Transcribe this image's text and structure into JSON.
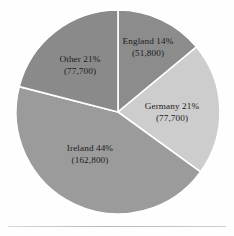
{
  "figure": {
    "background_color": "#fefefe",
    "rule_color": "#c2c2c2"
  },
  "chart_data": {
    "type": "pie",
    "title": "",
    "subtitle": "",
    "xlabel": "",
    "ylabel": "",
    "legend_position": "none",
    "grid": false,
    "label_style": "inside-slice",
    "start_angle_deg": 0,
    "direction": "clockwise",
    "categories": [
      "England",
      "Germany",
      "Ireland",
      "Other"
    ],
    "values": [
      51800,
      77700,
      162800,
      77700
    ],
    "percentages": [
      14,
      21,
      44,
      21
    ],
    "colors": [
      "#8c8c8c",
      "#cdcdcd",
      "#9b9b9b",
      "#8a8a8a"
    ],
    "separator_color": "#ffffff",
    "slices": [
      {
        "name": "England",
        "percent_text": "England 14%",
        "value_text": "(51,800)",
        "percent": 14,
        "value": 51800,
        "color": "#8c8c8c",
        "start_angle_deg": 0,
        "end_angle_deg": 50.4
      },
      {
        "name": "Germany",
        "percent_text": "Germany 21%",
        "value_text": "(77,700)",
        "percent": 21,
        "value": 77700,
        "color": "#cdcdcd",
        "start_angle_deg": 50.4,
        "end_angle_deg": 126.0
      },
      {
        "name": "Ireland",
        "percent_text": "Ireland 44%",
        "value_text": "(162,800)",
        "percent": 44,
        "value": 162800,
        "color": "#9b9b9b",
        "start_angle_deg": 126.0,
        "end_angle_deg": 284.4
      },
      {
        "name": "Other",
        "percent_text": "Other 21%",
        "value_text": "(77,700)",
        "percent": 21,
        "value": 77700,
        "color": "#8a8a8a",
        "start_angle_deg": 284.4,
        "end_angle_deg": 360.0
      }
    ]
  }
}
